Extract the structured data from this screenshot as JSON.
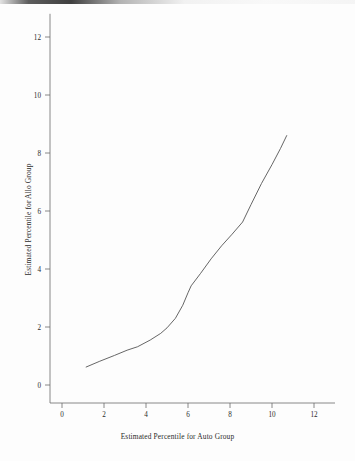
{
  "chart_data": {
    "type": "line",
    "title": "",
    "subtitle": "",
    "xlabel": "Estimated Percentile for Auto Group",
    "ylabel": "Estimated Percentile for Allo Group",
    "xlim": [
      -0.6,
      13.0
    ],
    "ylim": [
      -0.6,
      12.8
    ],
    "xticks": [
      0,
      2,
      4,
      6,
      8,
      10,
      12
    ],
    "yticks": [
      0,
      2,
      4,
      6,
      8,
      10,
      12
    ],
    "xtick_labels": [
      "0",
      "2",
      "4",
      "6",
      "8",
      "10",
      "12"
    ],
    "ytick_labels": [
      "0",
      "2",
      "4",
      "6",
      "8",
      "10",
      "12"
    ],
    "grid": false,
    "legend": false,
    "legend_position": "none",
    "line_color": "#555555",
    "background_color": "#fdfdfd",
    "axis_color": "#6b6b6b",
    "series": [
      {
        "name": "Estimated percentile curve",
        "points": [
          [
            1.15,
            0.62
          ],
          [
            1.8,
            0.82
          ],
          [
            2.5,
            1.02
          ],
          [
            3.1,
            1.2
          ],
          [
            3.6,
            1.32
          ],
          [
            4.2,
            1.55
          ],
          [
            4.7,
            1.78
          ],
          [
            5.0,
            1.97
          ],
          [
            5.4,
            2.3
          ],
          [
            5.75,
            2.75
          ],
          [
            6.0,
            3.18
          ],
          [
            6.15,
            3.42
          ],
          [
            6.6,
            3.85
          ],
          [
            7.1,
            4.35
          ],
          [
            7.6,
            4.8
          ],
          [
            8.1,
            5.2
          ],
          [
            8.6,
            5.62
          ],
          [
            9.0,
            6.22
          ],
          [
            9.5,
            6.95
          ],
          [
            10.0,
            7.6
          ],
          [
            10.4,
            8.15
          ],
          [
            10.7,
            8.6
          ]
        ]
      }
    ]
  }
}
